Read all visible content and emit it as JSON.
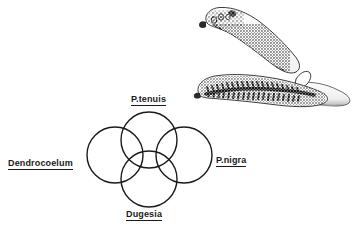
{
  "figure": {
    "title": "",
    "background_color": "#ffffff",
    "ink_color": "#1a1a1a",
    "width": 364,
    "height": 235
  },
  "diagram": {
    "type": "four-circle-rosette-venn",
    "stroke_color": "#1a1a1a",
    "stroke_width": 1.4,
    "fill": "none",
    "circles": [
      {
        "id": "dendrocoelum",
        "position": "left",
        "cx": 115,
        "cy": 155,
        "r": 28
      },
      {
        "id": "ptenuis",
        "position": "top",
        "cx": 149,
        "cy": 140,
        "r": 28
      },
      {
        "id": "pnigra",
        "position": "right",
        "cx": 184,
        "cy": 155,
        "r": 28
      },
      {
        "id": "dugesia",
        "position": "bottom",
        "cx": 149,
        "cy": 179,
        "r": 28
      }
    ],
    "labels": {
      "dendrocoelum": "Dendrocoelum",
      "ptenuis": "P.tenuis",
      "pnigra": "P.nigra",
      "dugesia": "Dugesia"
    }
  },
  "illustration": {
    "name": "planarian-flatworms-drawing",
    "subject": "Two overlapping planarian flatworms shown in dorsal view with branched intestinal diverticula",
    "style": "pen-and-ink scientific drawing",
    "ink_color": "#111111",
    "outline_color": "#444444",
    "shading_color": "#9a9a9a",
    "position": {
      "x": 190,
      "y": 5,
      "width": 170,
      "height": 105
    },
    "features": [
      "head with paired eyespots",
      "auricles at head margin",
      "branched gut (diverticula) rendered as dense black stipple",
      "pharynx region",
      "tapered pale tail"
    ]
  }
}
